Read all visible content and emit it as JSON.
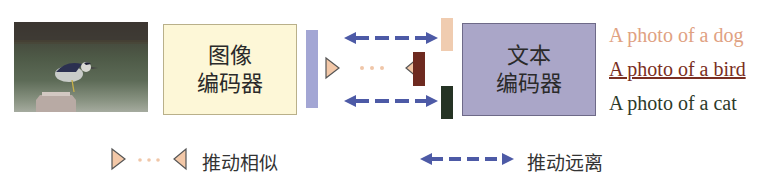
{
  "image_encoder": {
    "line1": "图像",
    "line2": "编码器"
  },
  "text_encoder": {
    "line1": "文本",
    "line2": "编码器"
  },
  "captions": [
    {
      "text": "A photo of a dog",
      "color": "#e0a182",
      "underlined": false
    },
    {
      "text": "A photo of a bird",
      "color": "#7a2e22",
      "underlined": true
    },
    {
      "text": "A photo of a cat",
      "color": "#2d3a2a",
      "underlined": false
    }
  ],
  "embedding_colors": {
    "image": "#a3a6d4",
    "dog": "#f0ccb0",
    "bird": "#6e2a20",
    "cat": "#253324",
    "arrow": "#4d5aa6",
    "triangle_fill": "#f3c8a8",
    "dots": "#f0c6a8"
  },
  "legend": {
    "pull_label": "推动相似",
    "push_label": "推动远离"
  }
}
